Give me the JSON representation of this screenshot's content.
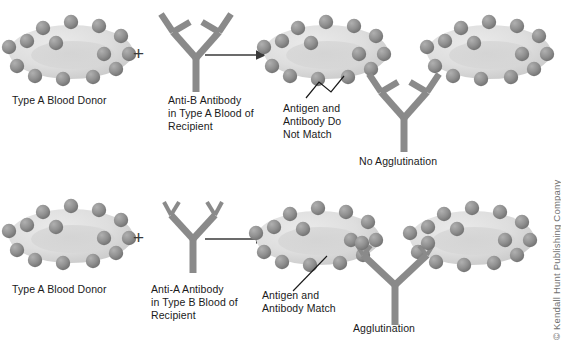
{
  "figure": {
    "colors": {
      "cell_fill": "#dedede",
      "cell_fill_dark": "#c9c9c9",
      "antigen": "#8f8f8f",
      "antigen_dark": "#757575",
      "antibody": "#8a8a8a",
      "arrow": "#3a3a3a",
      "text": "#1a1a1a",
      "copyright": "#707070",
      "background": "#ffffff"
    }
  },
  "rows": [
    {
      "id": "no-agglutination",
      "donor_label": "Type A Blood Donor",
      "plus_sign": "+",
      "antibody_label": "Anti-B Antibody\nin Type A Blood of\nRecipient",
      "antibody_type": "anti-B",
      "callout_label": "Antigen and\nAntibody Do\nNot Match",
      "result_label": "No Agglutination",
      "arrow_icon": "right-arrow-icon"
    },
    {
      "id": "agglutination",
      "donor_label": "Type A Blood Donor",
      "plus_sign": "+",
      "antibody_label": "Anti-A Antibody\nin Type B Blood of\nRecipient",
      "antibody_type": "anti-A",
      "callout_label": "Antigen and\nAntibody Match",
      "result_label": "Agglutination",
      "arrow_icon": "right-arrow-icon"
    }
  ],
  "credit": {
    "text": "© Kendall Hunt Publishing Company"
  }
}
